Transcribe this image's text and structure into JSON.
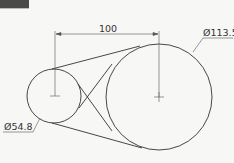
{
  "title_tab": {
    "color": "#4a4a4a"
  },
  "dimensions": {
    "center_distance": "100",
    "large_diameter": "Ø113.5",
    "small_diameter": "Ø54.8"
  },
  "colors": {
    "line": "#333333",
    "background": "#f7f7f5"
  }
}
